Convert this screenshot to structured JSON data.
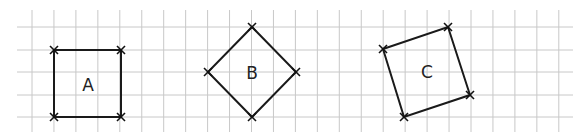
{
  "diagram": {
    "type": "grid-shapes",
    "grid": {
      "x0": 32,
      "y0": 5,
      "spacing": 22,
      "cols": 25,
      "rows": 6,
      "x_end": 573,
      "y_end": 132,
      "color": "#c8c8c8"
    },
    "shapes": [
      {
        "label": "A",
        "points": [
          [
            54,
            50
          ],
          [
            121,
            50
          ],
          [
            121,
            117
          ],
          [
            54,
            117
          ]
        ],
        "label_pos": [
          88,
          85
        ]
      },
      {
        "label": "B",
        "points": [
          [
            252,
            27
          ],
          [
            296,
            72
          ],
          [
            252,
            117
          ],
          [
            208,
            72
          ]
        ],
        "label_pos": [
          252,
          73
        ]
      },
      {
        "label": "C",
        "points": [
          [
            383,
            49
          ],
          [
            448,
            27
          ],
          [
            470,
            95
          ],
          [
            404,
            117
          ]
        ],
        "label_pos": [
          427,
          72
        ]
      }
    ],
    "line_color": "#1a1a1a"
  }
}
